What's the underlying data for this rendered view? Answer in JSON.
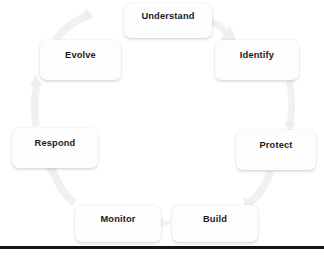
{
  "diagram": {
    "type": "cycle",
    "title": "",
    "node_count": 7,
    "nodes": [
      {
        "id": "understand",
        "label": "Understand",
        "position": "top"
      },
      {
        "id": "identify",
        "label": "Identify",
        "position": "top-right"
      },
      {
        "id": "protect",
        "label": "Protect",
        "position": "right"
      },
      {
        "id": "build",
        "label": "Build",
        "position": "bottom-right"
      },
      {
        "id": "monitor",
        "label": "Monitor",
        "position": "bottom-left"
      },
      {
        "id": "respond",
        "label": "Respond",
        "position": "left"
      },
      {
        "id": "evolve",
        "label": "Evolve",
        "position": "top-left"
      }
    ],
    "connections": [
      {
        "from": "understand",
        "to": "identify"
      },
      {
        "from": "identify",
        "to": "protect"
      },
      {
        "from": "protect",
        "to": "build"
      },
      {
        "from": "build",
        "to": "monitor"
      },
      {
        "from": "monitor",
        "to": "respond"
      },
      {
        "from": "respond",
        "to": "evolve"
      },
      {
        "from": "evolve",
        "to": "understand"
      }
    ],
    "colors": {
      "node_fill": "#fdfdfd",
      "node_text": "#1b1b1b",
      "arrow": "#ededed",
      "rule": "#141414",
      "background": "#ffffff"
    }
  },
  "footer": {
    "rule_visible": true
  }
}
